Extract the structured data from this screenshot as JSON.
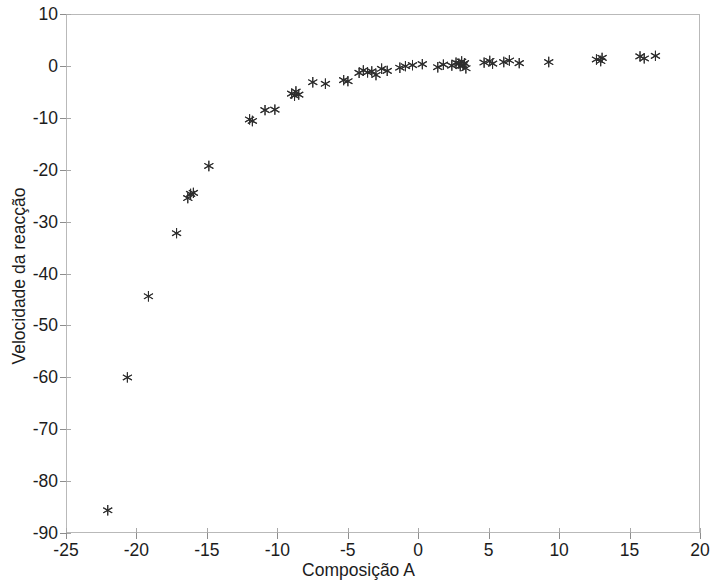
{
  "chart_data": {
    "type": "scatter",
    "title": "",
    "xlabel": "Composição A",
    "ylabel": "Velocidade da reacção",
    "xlim": [
      -25,
      20
    ],
    "ylim": [
      -90,
      10
    ],
    "xticks": [
      -25,
      -20,
      -15,
      -10,
      -5,
      0,
      5,
      10,
      15,
      20
    ],
    "xtick_labels": [
      "-25",
      "-20",
      "-15",
      "-10",
      "-5",
      "0",
      "5",
      "10",
      "15",
      "20"
    ],
    "yticks": [
      10,
      0,
      -10,
      -20,
      -30,
      -40,
      -50,
      -60,
      -70,
      -80,
      -90
    ],
    "ytick_labels": [
      "10",
      "0",
      "-10",
      "-20",
      "-30",
      "-40",
      "-50",
      "-60",
      "-70",
      "-80",
      "-90"
    ],
    "grid": false,
    "legend": null,
    "marker": "asterisk",
    "marker_color": "#2e2e2e",
    "series": [
      {
        "name": "Velocidade da reacção vs Composição A",
        "points": [
          [
            -22.1,
            -85.8
          ],
          [
            -20.7,
            -60.1
          ],
          [
            -19.2,
            -44.4
          ],
          [
            -17.2,
            -32.2
          ],
          [
            -16.4,
            -25.4
          ],
          [
            -16.2,
            -24.6
          ],
          [
            -16.0,
            -24.4
          ],
          [
            -14.9,
            -19.2
          ],
          [
            -12.0,
            -10.2
          ],
          [
            -11.8,
            -10.5
          ],
          [
            -10.9,
            -8.4
          ],
          [
            -10.2,
            -8.3
          ],
          [
            -9.0,
            -5.2
          ],
          [
            -8.8,
            -5.6
          ],
          [
            -8.7,
            -4.8
          ],
          [
            -8.5,
            -5.4
          ],
          [
            -7.5,
            -3.0
          ],
          [
            -6.6,
            -3.3
          ],
          [
            -5.3,
            -2.6
          ],
          [
            -5.0,
            -2.8
          ],
          [
            -4.2,
            -1.2
          ],
          [
            -3.9,
            -0.7
          ],
          [
            -3.6,
            -1.1
          ],
          [
            -3.3,
            -0.9
          ],
          [
            -3.0,
            -1.6
          ],
          [
            -2.6,
            -0.4
          ],
          [
            -2.2,
            -0.8
          ],
          [
            -1.3,
            -0.2
          ],
          [
            -0.9,
            0.1
          ],
          [
            -0.4,
            0.3
          ],
          [
            0.3,
            0.5
          ],
          [
            1.4,
            -0.1
          ],
          [
            1.8,
            0.4
          ],
          [
            2.4,
            0.2
          ],
          [
            2.7,
            0.8
          ],
          [
            2.9,
            0.6
          ],
          [
            3.0,
            0.1
          ],
          [
            3.1,
            1.0
          ],
          [
            3.2,
            0.3
          ],
          [
            3.3,
            0.7
          ],
          [
            3.4,
            -0.3
          ],
          [
            4.7,
            0.8
          ],
          [
            5.1,
            1.1
          ],
          [
            5.3,
            0.6
          ],
          [
            6.1,
            0.9
          ],
          [
            6.5,
            1.2
          ],
          [
            7.2,
            0.7
          ],
          [
            9.3,
            0.9
          ],
          [
            12.7,
            1.4
          ],
          [
            13.0,
            1.1
          ],
          [
            13.1,
            1.7
          ],
          [
            15.8,
            2.0
          ],
          [
            16.1,
            1.6
          ],
          [
            16.9,
            2.1
          ]
        ]
      }
    ]
  },
  "axes": {
    "frame_color": "#b9b9b9",
    "tick_color": "#8d8d8d"
  }
}
